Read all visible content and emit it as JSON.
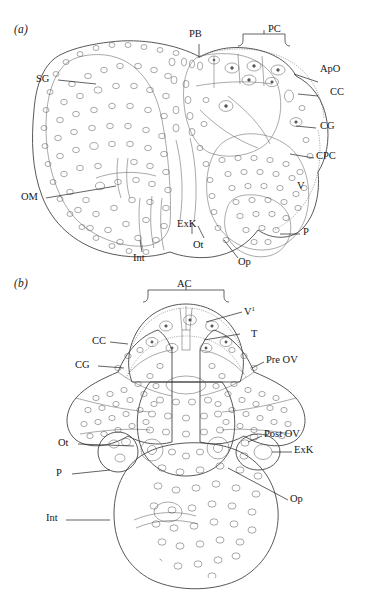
{
  "figure": {
    "type": "scientific-line-drawing",
    "panels": [
      {
        "id": "a",
        "letter": "(a)",
        "labels": [
          {
            "key": "PB",
            "text": "PB",
            "side": "top"
          },
          {
            "key": "PC",
            "text": "PC",
            "side": "top",
            "bracket": true
          },
          {
            "key": "SG",
            "text": "SG",
            "side": "left"
          },
          {
            "key": "ApO",
            "text": "ApO",
            "side": "right"
          },
          {
            "key": "CC",
            "text": "CC",
            "side": "right"
          },
          {
            "key": "CG",
            "text": "CG",
            "side": "right"
          },
          {
            "key": "CPC",
            "text": "CPC",
            "side": "right"
          },
          {
            "key": "V",
            "text": "V",
            "side": "right"
          },
          {
            "key": "P",
            "text": "P",
            "side": "right"
          },
          {
            "key": "OM",
            "text": "OM",
            "side": "left"
          },
          {
            "key": "Int",
            "text": "Int",
            "side": "bottom"
          },
          {
            "key": "ExK",
            "text": "ExK",
            "side": "bottom"
          },
          {
            "key": "Ot",
            "text": "Ot",
            "side": "bottom"
          },
          {
            "key": "Op",
            "text": "Op",
            "side": "bottom"
          }
        ]
      },
      {
        "id": "b",
        "letter": "(b)",
        "labels": [
          {
            "key": "AC",
            "text": "AC",
            "side": "top",
            "bracket": true
          },
          {
            "key": "V1",
            "text": "V",
            "sup": "1",
            "side": "right"
          },
          {
            "key": "T",
            "text": "T",
            "side": "right"
          },
          {
            "key": "PreOV",
            "text": "Pre OV",
            "side": "right"
          },
          {
            "key": "PostOV",
            "text": "Post OV",
            "side": "right"
          },
          {
            "key": "ExK",
            "text": "ExK",
            "side": "right"
          },
          {
            "key": "Op",
            "text": "Op",
            "side": "right"
          },
          {
            "key": "CC",
            "text": "CC",
            "side": "left"
          },
          {
            "key": "CG",
            "text": "CG",
            "side": "left"
          },
          {
            "key": "Ot",
            "text": "Ot",
            "side": "left"
          },
          {
            "key": "P",
            "text": "P",
            "side": "left"
          },
          {
            "key": "Int",
            "text": "Int",
            "side": "left"
          }
        ]
      }
    ]
  },
  "colors": {
    "ink": "#2b2b2b",
    "leader": "#202020",
    "tissue": "#f6f5f1",
    "background": "#ffffff"
  }
}
